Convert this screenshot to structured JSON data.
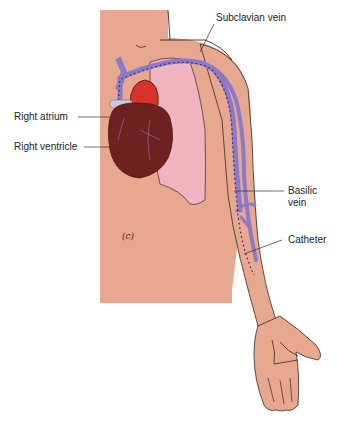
{
  "figure": {
    "panel_label": "(c)",
    "labels": {
      "subclavian_vein": "Subclavian vein",
      "right_atrium": "Right atrium",
      "right_ventricle": "Right ventricle",
      "basilic_vein_line1": "Basilic",
      "basilic_vein_line2": "vein",
      "catheter": "Catheter"
    },
    "colors": {
      "skin": "#e8a890",
      "vein": "#8b7ac8",
      "lung": "#f0b4c0",
      "heart": "#6e2220",
      "aorta": "#d8322a",
      "outline": "#3a2a22"
    }
  }
}
